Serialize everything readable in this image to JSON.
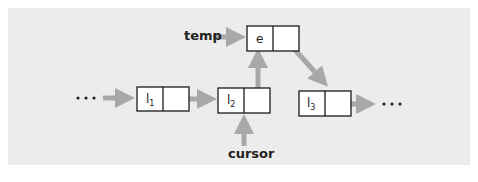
{
  "diagram": {
    "type": "linked-list-insertion",
    "colors": {
      "panel_bg": "#ececec",
      "arrow": "#a8a8a8",
      "node_border": "#1a1a1a",
      "node_fill": "#ffffff"
    },
    "labels": {
      "temp": "temp",
      "cursor": "cursor",
      "ellipsis_left": "• • •",
      "ellipsis_right": "• • •"
    },
    "nodes": [
      {
        "id": "l1",
        "base": "l",
        "sub": "1"
      },
      {
        "id": "l2",
        "base": "l",
        "sub": "2"
      },
      {
        "id": "e",
        "base": "e",
        "sub": ""
      },
      {
        "id": "l3",
        "base": "l",
        "sub": "3"
      }
    ],
    "edges": [
      {
        "from": "ellipsis_left",
        "to": "l1"
      },
      {
        "from": "l1",
        "to": "l2"
      },
      {
        "from": "l2",
        "to": "e"
      },
      {
        "from": "e",
        "to": "l3"
      },
      {
        "from": "l3",
        "to": "ellipsis_right"
      },
      {
        "from": "temp",
        "to": "e"
      },
      {
        "from": "cursor",
        "to": "l2"
      }
    ]
  }
}
